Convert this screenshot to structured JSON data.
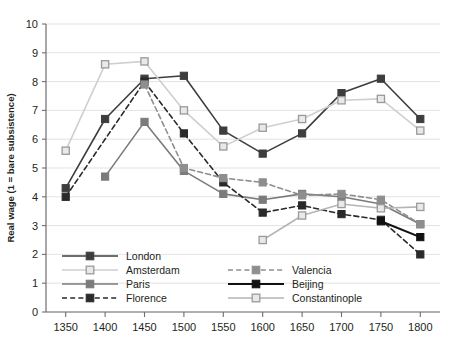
{
  "chart_data": {
    "type": "line",
    "title": "",
    "xlabel": "",
    "ylabel": "Real wage (1 = bare subsistence)",
    "x": [
      1350,
      1400,
      1450,
      1500,
      1550,
      1600,
      1650,
      1700,
      1750,
      1800
    ],
    "xtick_labels": [
      "1350",
      "1400",
      "1450",
      "1500",
      "1550",
      "1600",
      "1650",
      "1700",
      "1750",
      "1800"
    ],
    "ytick_labels": [
      "0",
      "1",
      "2",
      "3",
      "4",
      "5",
      "6",
      "7",
      "8",
      "9",
      "10"
    ],
    "xlim": [
      1325,
      1825
    ],
    "ylim": [
      0,
      10
    ],
    "grid": true,
    "legend_position": "inside-bottom-left",
    "series": [
      {
        "name": "London",
        "color": "#3d3d3d",
        "style": "solid",
        "marker": "filled-square",
        "x": [
          1350,
          1400,
          1450,
          1500,
          1550,
          1600,
          1650,
          1700,
          1750,
          1800
        ],
        "values": [
          4.3,
          6.7,
          8.1,
          8.2,
          6.3,
          5.5,
          6.2,
          7.6,
          8.1,
          6.7
        ]
      },
      {
        "name": "Amsterdam",
        "color": "#cfcfcf",
        "style": "solid",
        "marker": "open-square",
        "x": [
          1350,
          1400,
          1450,
          1500,
          1550,
          1600,
          1650,
          1700,
          1750,
          1800
        ],
        "values": [
          5.6,
          8.6,
          8.7,
          7.0,
          5.75,
          6.4,
          6.7,
          7.35,
          7.4,
          6.3
        ]
      },
      {
        "name": "Paris",
        "color": "#7b7b7b",
        "style": "solid",
        "marker": "filled-square",
        "x": [
          1400,
          1450,
          1500,
          1550,
          1600,
          1650,
          1700,
          1750,
          1800
        ],
        "values": [
          4.7,
          6.6,
          4.9,
          4.1,
          3.9,
          4.1,
          4.0,
          3.75,
          3.05
        ]
      },
      {
        "name": "Florence",
        "color": "#2a2a2a",
        "style": "dashed",
        "marker": "filled-square",
        "x": [
          1350,
          1450,
          1500,
          1550,
          1600,
          1650,
          1700,
          1750,
          1800
        ],
        "values": [
          4.0,
          8.0,
          6.2,
          4.5,
          3.45,
          3.7,
          3.4,
          3.2,
          2.0
        ]
      },
      {
        "name": "Valencia",
        "color": "#8e8e8e",
        "style": "dashed",
        "marker": "filled-square",
        "x": [
          1450,
          1500,
          1550,
          1600,
          1650,
          1700,
          1750,
          1800
        ],
        "values": [
          7.9,
          5.0,
          4.65,
          4.5,
          4.05,
          4.1,
          3.9,
          3.05
        ]
      },
      {
        "name": "Beijing",
        "color": "#111111",
        "style": "solid",
        "marker": "filled-square",
        "x": [
          1750,
          1800
        ],
        "values": [
          3.15,
          2.6
        ]
      },
      {
        "name": "Constantinople",
        "color": "#b5b5b5",
        "style": "solid",
        "marker": "open-square",
        "x": [
          1600,
          1650,
          1700,
          1750,
          1800
        ],
        "values": [
          2.5,
          3.35,
          3.75,
          3.6,
          3.65
        ]
      }
    ],
    "legend": [
      {
        "name": "London",
        "color": "#3d3d3d",
        "style": "solid",
        "marker": "filled-square",
        "col": 0,
        "row": 0
      },
      {
        "name": "Amsterdam",
        "color": "#cfcfcf",
        "style": "solid",
        "marker": "open-square",
        "col": 0,
        "row": 1
      },
      {
        "name": "Paris",
        "color": "#7b7b7b",
        "style": "solid",
        "marker": "filled-square",
        "col": 0,
        "row": 2
      },
      {
        "name": "Florence",
        "color": "#2a2a2a",
        "style": "dashed",
        "marker": "filled-square",
        "col": 0,
        "row": 3
      },
      {
        "name": "Valencia",
        "color": "#8e8e8e",
        "style": "dashed",
        "marker": "filled-square",
        "col": 1,
        "row": 1
      },
      {
        "name": "Beijing",
        "color": "#111111",
        "style": "solid",
        "marker": "filled-square",
        "col": 1,
        "row": 2
      },
      {
        "name": "Constantinople",
        "color": "#b5b5b5",
        "style": "solid",
        "marker": "open-square",
        "col": 1,
        "row": 3
      }
    ]
  }
}
